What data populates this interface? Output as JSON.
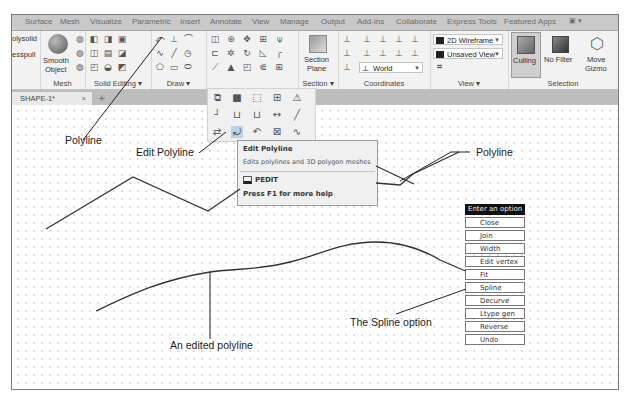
{
  "ribbon_tabs": [
    "Surface",
    "Mesh",
    "Visualize",
    "Parametric",
    "Insert",
    "Annotate",
    "View",
    "Manage",
    "Output",
    "Add-ins",
    "Collaborate",
    "Express Tools",
    "Featured Apps"
  ],
  "ribbon_tab_extra_icon": "panel-toggle-icon",
  "panels": {
    "modeling": {
      "items": [
        "Polysolid",
        "Presspull"
      ]
    },
    "mesh": {
      "title": "Mesh",
      "smooth_object": "Smooth Object",
      "smooth_line1": "Smooth",
      "smooth_line2": "Object"
    },
    "solid_editing": {
      "title": "Solid Editing ▾"
    },
    "draw": {
      "title": "Draw ▾"
    },
    "modify": {
      "title": ""
    },
    "section": {
      "title": "Section ▾",
      "section_plane_line1": "Section",
      "section_plane_line2": "Plane"
    },
    "coordinates": {
      "title": "Coordinates",
      "ucs_value": "World"
    },
    "view": {
      "title": "View ▾",
      "visual_style": "2D Wireframe",
      "named_view": "Unsaved View"
    },
    "selection": {
      "title": "Selection",
      "culling": "Culling",
      "no_filter": "No Filter",
      "move_gizmo_line1": "Move",
      "move_gizmo_line2": "Gizmo"
    }
  },
  "document_tab": {
    "label": "SHAPE-1*",
    "close": "×",
    "new_tab": "+"
  },
  "tooltip": {
    "title": "Edit Polyline",
    "description": "Edits polylines and 3D polygon meshes",
    "command": "PEDIT",
    "help": "Press F1 for more help"
  },
  "option_menu": {
    "header": "Enter an option",
    "items": [
      "Close",
      "Join",
      "Width",
      "Edit vertex",
      "Fit",
      "Spline",
      "Decurve",
      "Ltype gen",
      "Reverse",
      "Undo"
    ]
  },
  "annotations": {
    "polyline_left": "Polyline",
    "edit_polyline": "Edit Polyline",
    "polyline_right": "Polyline",
    "spline_option": "The Spline option",
    "edited_polyline": "An edited polyline"
  }
}
